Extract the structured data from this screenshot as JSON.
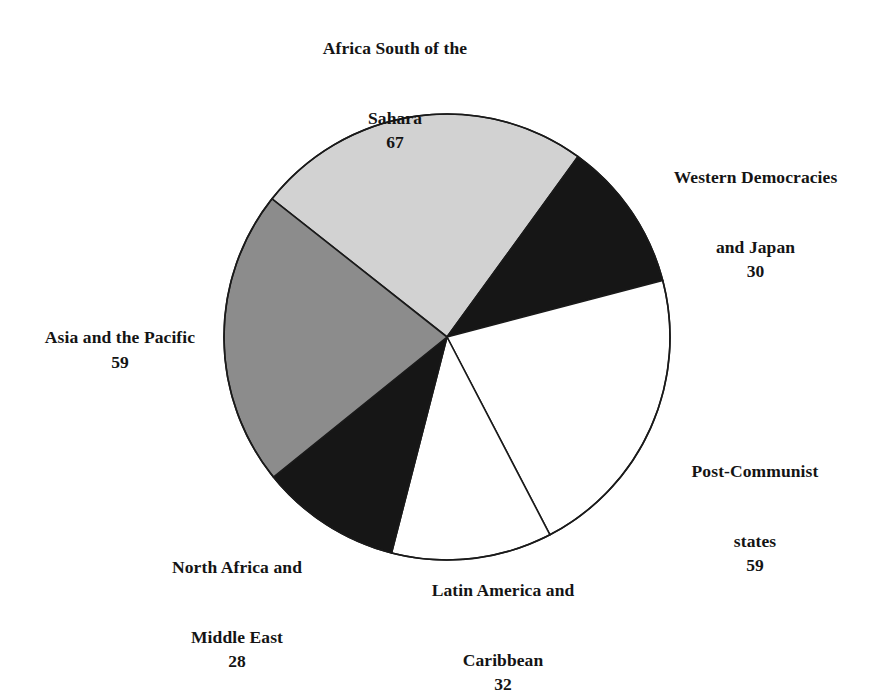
{
  "chart_data": {
    "type": "pie",
    "title": "",
    "subtitle": "",
    "xlabel": "",
    "ylabel": "",
    "total": 275,
    "legend_position": "outside-labels",
    "grid": false,
    "categories": [
      "Africa South of the Sahara",
      "Western Democracies and Japan",
      "Post-Communist states",
      "Latin America and Caribbean",
      "North Africa and Middle East",
      "Asia and the Pacific"
    ],
    "values": [
      67,
      30,
      59,
      32,
      28,
      59
    ],
    "slices": [
      {
        "label_line1": "Africa South of the",
        "label_line2": "Sahara",
        "label": "Africa South of the Sahara",
        "value": 67,
        "color": "#d2d2d2",
        "start_angle": 54,
        "end_angle": 141.7
      },
      {
        "label_line1": "Western Democracies",
        "label_line2": "and Japan",
        "label": "Western Democracies and Japan",
        "value": 30,
        "color": "#161616",
        "start_angle": 14.7,
        "end_angle": 54
      },
      {
        "label_line1": "Post-Communist",
        "label_line2": "states",
        "label": "Post-Communist states",
        "value": 59,
        "color": "#ffffff",
        "start_angle": -62.5,
        "end_angle": 14.7
      },
      {
        "label_line1": "Latin America and",
        "label_line2": "Caribbean",
        "label": "Latin America and Caribbean",
        "value": 32,
        "color": "#ffffff",
        "start_angle": -104.4,
        "end_angle": -62.5
      },
      {
        "label_line1": "North Africa and",
        "label_line2": "Middle East",
        "label": "North Africa and Middle East",
        "value": 28,
        "color": "#161616",
        "start_angle": -141.1,
        "end_angle": -104.4
      },
      {
        "label_line1": "Asia and the Pacific",
        "label_line2": "",
        "label": "Asia and the Pacific",
        "value": 59,
        "color": "#8c8c8c",
        "start_angle": -218.3,
        "end_angle": -141.1
      }
    ],
    "geometry": {
      "center_x": 447,
      "center_y": 337,
      "radius": 223,
      "stroke_color": "#1a1a1a",
      "stroke_width": 1.6
    }
  },
  "labels": {
    "africa_south_sahara": {
      "line1": "Africa South of the",
      "line2": "Sahara",
      "value": "67"
    },
    "western_democracies": {
      "line1": "Western Democracies",
      "line2": "and Japan",
      "value": "30"
    },
    "post_communist": {
      "line1": "Post-Communist",
      "line2": "states",
      "value": "59"
    },
    "latin_america": {
      "line1": "Latin America and",
      "line2": "Caribbean",
      "value": "32"
    },
    "north_africa": {
      "line1": "North Africa and",
      "line2": "Middle East",
      "value": "28"
    },
    "asia_pacific": {
      "line1": "Asia and the Pacific",
      "line2": "",
      "value": "59"
    }
  }
}
